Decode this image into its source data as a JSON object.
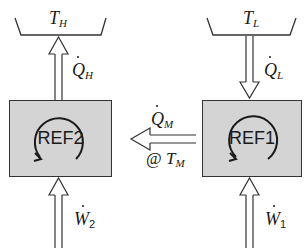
{
  "diagram": {
    "type": "cascade-refrigeration-schematic",
    "reservoirs": {
      "hot": {
        "label_main": "T",
        "label_sub": "H"
      },
      "cold": {
        "label_main": "T",
        "label_sub": "L"
      }
    },
    "cycles": {
      "left": {
        "label": "REF2"
      },
      "right": {
        "label": "REF1"
      }
    },
    "flows": {
      "q_h": {
        "main": "Q",
        "sub": "H",
        "direction": "up"
      },
      "q_l": {
        "main": "Q",
        "sub": "L",
        "direction": "down"
      },
      "q_m": {
        "main": "Q",
        "sub": "M",
        "direction": "left",
        "note_prefix": "@ ",
        "note_main": "T",
        "note_sub": "M"
      },
      "w_2": {
        "main": "W",
        "sub": "2",
        "direction": "up"
      },
      "w_1": {
        "main": "W",
        "sub": "1",
        "direction": "up"
      }
    },
    "colors": {
      "box_fill": "#d4d4d4",
      "stroke": "#333333",
      "background": "#ffffff"
    }
  }
}
